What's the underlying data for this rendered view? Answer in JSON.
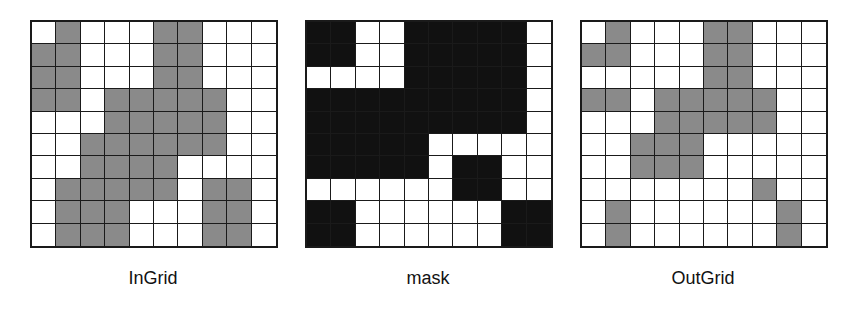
{
  "colors": {
    "gray_fill": "#8a8a8a",
    "black_fill": "#111111",
    "white_fill": "#ffffff",
    "grid_line": "#1a1a1a"
  },
  "panels": [
    {
      "id": "ingrid",
      "label": "InGrid",
      "fill": "gray",
      "cells": [
        [
          0,
          1,
          0,
          0,
          0,
          1,
          1,
          0,
          0,
          0
        ],
        [
          1,
          1,
          0,
          0,
          0,
          1,
          1,
          0,
          0,
          0
        ],
        [
          1,
          1,
          0,
          0,
          0,
          1,
          1,
          0,
          0,
          0
        ],
        [
          1,
          1,
          0,
          1,
          1,
          1,
          1,
          1,
          0,
          0
        ],
        [
          0,
          0,
          0,
          1,
          1,
          1,
          1,
          1,
          0,
          0
        ],
        [
          0,
          0,
          1,
          1,
          1,
          1,
          1,
          1,
          0,
          0
        ],
        [
          0,
          0,
          1,
          1,
          1,
          1,
          0,
          0,
          0,
          0
        ],
        [
          0,
          1,
          1,
          1,
          1,
          1,
          0,
          1,
          1,
          0
        ],
        [
          0,
          1,
          1,
          1,
          0,
          0,
          0,
          1,
          1,
          0
        ],
        [
          0,
          1,
          1,
          1,
          0,
          0,
          0,
          1,
          1,
          0
        ]
      ]
    },
    {
      "id": "mask",
      "label": "mask",
      "fill": "black",
      "cells": [
        [
          1,
          1,
          0,
          0,
          1,
          1,
          1,
          1,
          1,
          0
        ],
        [
          1,
          1,
          0,
          0,
          1,
          1,
          1,
          1,
          1,
          0
        ],
        [
          0,
          0,
          0,
          0,
          1,
          1,
          1,
          1,
          1,
          0
        ],
        [
          1,
          1,
          1,
          1,
          1,
          1,
          1,
          1,
          1,
          0
        ],
        [
          1,
          1,
          1,
          1,
          1,
          1,
          1,
          1,
          1,
          0
        ],
        [
          1,
          1,
          1,
          1,
          1,
          0,
          0,
          0,
          0,
          0
        ],
        [
          1,
          1,
          1,
          1,
          1,
          0,
          1,
          1,
          0,
          0
        ],
        [
          0,
          0,
          0,
          0,
          0,
          0,
          1,
          1,
          0,
          0
        ],
        [
          1,
          1,
          0,
          0,
          0,
          0,
          0,
          0,
          1,
          1
        ],
        [
          1,
          1,
          0,
          0,
          0,
          0,
          0,
          0,
          1,
          1
        ]
      ]
    },
    {
      "id": "outgrid",
      "label": "OutGrid",
      "fill": "gray",
      "cells": [
        [
          0,
          1,
          0,
          0,
          0,
          1,
          1,
          0,
          0,
          0
        ],
        [
          1,
          1,
          0,
          0,
          0,
          1,
          1,
          0,
          0,
          0
        ],
        [
          0,
          0,
          0,
          0,
          0,
          1,
          1,
          0,
          0,
          0
        ],
        [
          1,
          1,
          0,
          1,
          1,
          1,
          1,
          1,
          0,
          0
        ],
        [
          0,
          0,
          0,
          1,
          1,
          1,
          1,
          1,
          0,
          0
        ],
        [
          0,
          0,
          1,
          1,
          1,
          0,
          0,
          0,
          0,
          0
        ],
        [
          0,
          0,
          1,
          1,
          1,
          0,
          0,
          0,
          0,
          0
        ],
        [
          0,
          0,
          0,
          0,
          0,
          0,
          0,
          1,
          0,
          0
        ],
        [
          0,
          1,
          0,
          0,
          0,
          0,
          0,
          0,
          1,
          0
        ],
        [
          0,
          1,
          0,
          0,
          0,
          0,
          0,
          0,
          1,
          0
        ]
      ]
    }
  ]
}
